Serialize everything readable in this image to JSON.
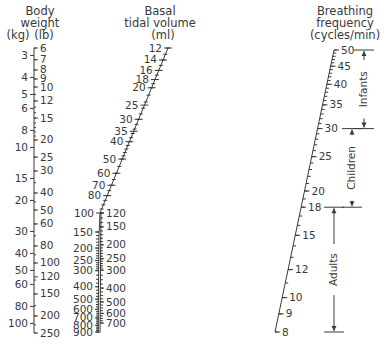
{
  "nomogram": {
    "body_weight": {
      "title_lines": [
        "Body",
        "weight"
      ],
      "unit_kg": "(kg)",
      "unit_lb": "(lb)",
      "kg_ticks": [
        "3",
        "4",
        "5",
        "6",
        "8",
        "10",
        "15",
        "20",
        "30",
        "40",
        "50",
        "60",
        "80",
        "100"
      ],
      "lb_ticks": [
        "6",
        "7",
        "8",
        "9",
        "10",
        "12",
        "15",
        "20",
        "25",
        "30",
        "40",
        "50",
        "60",
        "80",
        "100",
        "120",
        "150",
        "200",
        "250"
      ]
    },
    "tidal_volume": {
      "title_lines": [
        "Basal",
        "tidal volume"
      ],
      "unit": "(ml)",
      "upper_ticks": [
        "12",
        "14",
        "16",
        "18",
        "20",
        "25",
        "30",
        "35",
        "40",
        "50",
        "60",
        "70",
        "80",
        "100"
      ],
      "left_lower_ticks": [
        "150",
        "200",
        "250",
        "300",
        "400",
        "500",
        "600",
        "700",
        "800",
        "900"
      ],
      "right_lower_ticks": [
        "120",
        "150",
        "200",
        "250",
        "300",
        "400",
        "500",
        "600",
        "700"
      ]
    },
    "breathing_frequency": {
      "title_lines": [
        "Breathing",
        "frequency"
      ],
      "unit": "(cycles/min)",
      "ticks": [
        "50",
        "45",
        "40",
        "35",
        "30",
        "25",
        "20",
        "18",
        "15",
        "12",
        "10",
        "9",
        "8"
      ],
      "groups": [
        {
          "label": "Infants",
          "from": "50",
          "to": "30"
        },
        {
          "label": "Children",
          "from": "30",
          "to": "18"
        },
        {
          "label": "Adults",
          "from": "18",
          "to": "8"
        }
      ]
    }
  }
}
